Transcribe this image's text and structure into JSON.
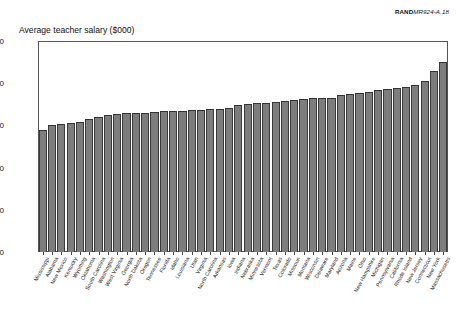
{
  "figure": {
    "id_bold": "RAND",
    "id_italic": "MR924-A.18"
  },
  "chart_data": {
    "type": "bar",
    "title": "Average teacher salary ($000)",
    "xlabel": "",
    "ylabel": "Average teacher salary ($000)",
    "ylim": [
      0,
      50
    ],
    "yticks": [
      0,
      10,
      20,
      30,
      40,
      50
    ],
    "grid": false,
    "legend": null,
    "bar_color": "#7d7d7d",
    "categories": [
      "Mississippi",
      "Alabama",
      "New Mexico",
      "Kentucky",
      "Wyoming",
      "Oklahoma",
      "South Carolina",
      "Washington",
      "West Virginia",
      "Georgia",
      "North Dakota",
      "Oregon",
      "Tennessee",
      "Florida",
      "Idaho",
      "Louisiana",
      "Utah",
      "Virginia",
      "North Carolina",
      "Arkansas",
      "Iowa",
      "Indiana",
      "Nebraska",
      "Minnesota",
      "Vermont",
      "Texas",
      "Colorado",
      "Missouri",
      "Montana",
      "Wisconsin",
      "Delaware",
      "Maryland",
      "Arizona",
      "Maine",
      "Ohio",
      "New Hampshire",
      "Michigan",
      "Pennsylvania",
      "California",
      "Rhode Island",
      "New Jersey",
      "Connecticut",
      "New York",
      "Massachusetts"
    ],
    "values": [
      29.0,
      30.1,
      30.4,
      30.6,
      30.7,
      31.6,
      31.9,
      32.4,
      32.8,
      32.9,
      32.9,
      33.0,
      33.1,
      33.3,
      33.4,
      33.5,
      33.6,
      33.7,
      33.9,
      34.0,
      34.2,
      34.8,
      35.0,
      35.2,
      35.4,
      35.6,
      35.8,
      36.1,
      36.2,
      36.4,
      36.5,
      36.6,
      37.3,
      37.5,
      37.7,
      38.0,
      38.4,
      38.6,
      38.8,
      39.1,
      39.5,
      40.5,
      43.0,
      45.0
    ]
  }
}
